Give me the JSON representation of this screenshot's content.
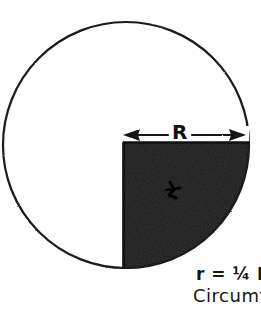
{
  "figure": {
    "background_color": "#fefefe",
    "ink_color": "#1a1a1a",
    "fill_color": "#1c1c1c",
    "circle": {
      "center_x": 126,
      "center_y": 145,
      "radius": 123,
      "stroke_width": 2.2
    },
    "shaded_sector": {
      "description": "lower-right quadrant filled solid black",
      "quadrant": "bottom-right",
      "corner_x": 123,
      "corner_y": 143
    },
    "dimension_arrow": {
      "label": "R",
      "meaning": "radius of large circle",
      "x_start": 124,
      "x_end": 246,
      "y": 135,
      "double_headed": true
    },
    "inner_mark": {
      "name": "small-r-mark",
      "description": "small hand-drawn r mark inside shaded quadrant",
      "x": 173,
      "y": 189
    }
  },
  "annotations": {
    "formula": "r = ¼ R",
    "circumference": "Circumf",
    "radius_label": "R"
  }
}
